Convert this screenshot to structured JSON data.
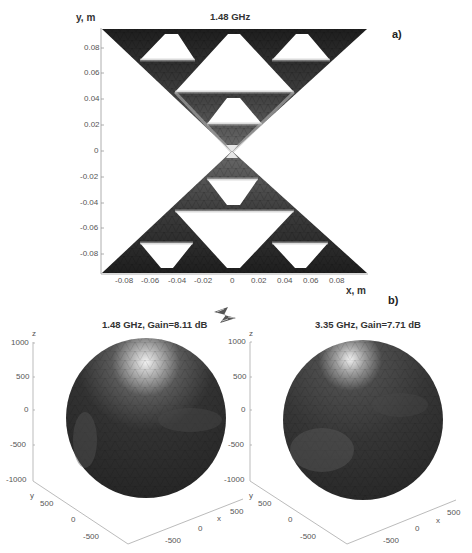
{
  "panel_a": {
    "label": "a)",
    "title": "1.48 GHz",
    "xlabel": "x, m",
    "ylabel": "y, m",
    "xticks": [
      "-0.08",
      "-0.06",
      "-0.04",
      "-0.02",
      "0",
      "0.02",
      "0.04",
      "0.06",
      "0.08"
    ],
    "yticks": [
      "0.08",
      "0.06",
      "0.04",
      "0.02",
      "0",
      "-0.02",
      "-0.04",
      "-0.06",
      "-0.08"
    ],
    "description": "Surface current distribution on Sierpinski bowtie antenna"
  },
  "panel_b": {
    "label": "b)",
    "left": {
      "title": "1.48 GHz, Gain=8.11 dB",
      "zlabel": "z",
      "ylabel": "y",
      "xlabel": "x",
      "zticks": [
        "1000",
        "500",
        "0",
        "-500",
        "-1000"
      ],
      "yticks": [
        "500",
        "0",
        "-500"
      ],
      "xticks": [
        "-500",
        "0",
        "500"
      ]
    },
    "right": {
      "title": "3.35 GHz, Gain=7.71 dB",
      "zlabel": "z",
      "ylabel": "y",
      "xlabel": "x",
      "zticks": [
        "1000",
        "500",
        "0",
        "-500",
        "-1000"
      ],
      "yticks": [
        "500",
        "0",
        "-500"
      ],
      "xticks": [
        "-500",
        "0",
        "500"
      ]
    }
  },
  "colors": {
    "metal_dark": "#2b2b2b",
    "metal_light": "#c8c8c8",
    "axis": "#999999",
    "sphere": "#333333"
  }
}
